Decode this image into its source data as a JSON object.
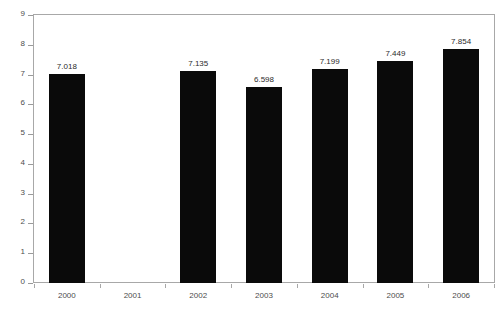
{
  "chart_data": {
    "type": "bar",
    "title": "",
    "xlabel": "",
    "ylabel": "# Millions",
    "categories": [
      "2000",
      "2001",
      "2002",
      "2003",
      "2004",
      "2005",
      "2006"
    ],
    "values": [
      7.018,
      null,
      7.135,
      6.598,
      7.199,
      7.449,
      7.854
    ],
    "data_labels": [
      "7.018",
      "",
      "7.135",
      "6.598",
      "7.199",
      "7.449",
      "7.854"
    ],
    "ylim": [
      0,
      9
    ],
    "yticks": [
      0,
      1,
      2,
      3,
      4,
      5,
      6,
      7,
      8,
      9
    ],
    "ytick_labels": [
      "0",
      "1",
      "2",
      "3",
      "4",
      "5",
      "6",
      "7",
      "8",
      "9"
    ],
    "grid": false,
    "legend": null,
    "bar_color": "#0a0a0a",
    "frame_color": "#a8a8a8",
    "text_color": "#4d4d4d",
    "background": "#ffffff"
  }
}
